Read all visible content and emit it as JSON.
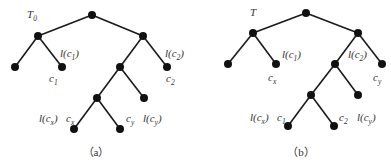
{
  "figures": [
    {
      "id": "a",
      "title": "T0",
      "title_main": "T",
      "title_sub": "0",
      "caption": "（a）",
      "edges": [
        [
          92,
          15,
          38,
          36
        ],
        [
          92,
          15,
          143,
          36
        ],
        [
          38,
          36,
          15,
          67
        ],
        [
          38,
          36,
          62,
          67
        ],
        [
          143,
          36,
          120,
          67
        ],
        [
          143,
          36,
          167,
          67
        ],
        [
          120,
          67,
          97,
          98
        ],
        [
          120,
          67,
          144,
          98
        ],
        [
          97,
          98,
          74,
          129
        ],
        [
          97,
          98,
          120,
          129
        ]
      ],
      "nodes": [
        [
          92,
          15
        ],
        [
          38,
          36
        ],
        [
          143,
          36
        ],
        [
          15,
          67
        ],
        [
          62,
          67
        ],
        [
          120,
          67
        ],
        [
          167,
          67
        ],
        [
          97,
          98
        ],
        [
          144,
          98
        ],
        [
          74,
          129
        ],
        [
          120,
          129
        ]
      ],
      "labels": [
        {
          "id": "l-c1",
          "pre": "l(c",
          "sub": "1",
          "post": ")",
          "x": 60,
          "y": 57
        },
        {
          "id": "c1",
          "pre": "c",
          "sub": "1",
          "post": "",
          "x": 49,
          "y": 82
        },
        {
          "id": "l-c2",
          "pre": "l(c",
          "sub": "2",
          "post": ")",
          "x": 165,
          "y": 57
        },
        {
          "id": "c2",
          "pre": "c",
          "sub": "2",
          "post": "",
          "x": 166,
          "y": 82
        },
        {
          "id": "l-cx",
          "pre": "l(c",
          "sub": "x",
          "post": ")",
          "x": 39,
          "y": 122
        },
        {
          "id": "cx",
          "pre": "c",
          "sub": "x",
          "post": "",
          "x": 66,
          "y": 122
        },
        {
          "id": "cy",
          "pre": "c",
          "sub": "y",
          "post": "",
          "x": 126,
          "y": 122
        },
        {
          "id": "l-cy",
          "pre": "l(c",
          "sub": "y",
          "post": ")",
          "x": 143,
          "y": 122
        }
      ],
      "title_pos": [
        27,
        18
      ],
      "caption_pos": [
        96,
        156
      ]
    },
    {
      "id": "b",
      "title": "T",
      "title_main": "T",
      "title_sub": "",
      "caption": "（b）",
      "edges": [
        [
          306,
          13,
          253,
          33
        ],
        [
          306,
          13,
          358,
          33
        ],
        [
          253,
          33,
          228,
          64
        ],
        [
          253,
          33,
          276,
          64
        ],
        [
          358,
          33,
          335,
          64
        ],
        [
          358,
          33,
          382,
          64
        ],
        [
          335,
          64,
          311,
          95
        ],
        [
          335,
          64,
          358,
          95
        ],
        [
          311,
          95,
          288,
          126
        ],
        [
          311,
          95,
          334,
          126
        ]
      ],
      "nodes": [
        [
          306,
          13
        ],
        [
          253,
          33
        ],
        [
          358,
          33
        ],
        [
          228,
          64
        ],
        [
          276,
          64
        ],
        [
          335,
          64
        ],
        [
          382,
          64
        ],
        [
          311,
          95
        ],
        [
          358,
          95
        ],
        [
          288,
          126
        ],
        [
          334,
          126
        ]
      ],
      "labels": [
        {
          "id": "l-c1",
          "pre": "l(c",
          "sub": "1",
          "post": ")",
          "x": 282,
          "y": 58
        },
        {
          "id": "cx",
          "pre": "c",
          "sub": "x",
          "post": "",
          "x": 268,
          "y": 81
        },
        {
          "id": "l-c2",
          "pre": "l(c",
          "sub": "2",
          "post": ")",
          "x": 348,
          "y": 58
        },
        {
          "id": "cy",
          "pre": "c",
          "sub": "y",
          "post": "",
          "x": 373,
          "y": 81
        },
        {
          "id": "l-cx",
          "pre": "l(c",
          "sub": "x",
          "post": ")",
          "x": 250,
          "y": 121
        },
        {
          "id": "c1",
          "pre": "c",
          "sub": "1",
          "post": "",
          "x": 277,
          "y": 121
        },
        {
          "id": "c2",
          "pre": "c",
          "sub": "2",
          "post": "",
          "x": 339,
          "y": 121
        },
        {
          "id": "l-cy",
          "pre": "l(c",
          "sub": "y",
          "post": ")",
          "x": 357,
          "y": 121
        }
      ],
      "title_pos": [
        250,
        16
      ],
      "caption_pos": [
        301,
        156
      ]
    }
  ]
}
